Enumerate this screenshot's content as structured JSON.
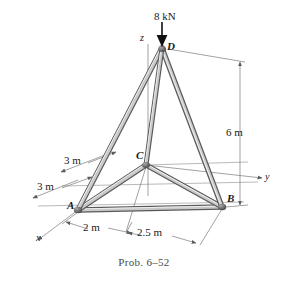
{
  "figure": {
    "caption": "Prob. 6–52",
    "type": "space-truss-free-body-diagram",
    "joints": [
      {
        "id": "A",
        "label": "A",
        "x": 78,
        "y": 210
      },
      {
        "id": "B",
        "label": "B",
        "x": 222,
        "y": 207
      },
      {
        "id": "C",
        "label": "C",
        "x": 146,
        "y": 165
      },
      {
        "id": "D",
        "label": "D",
        "x": 162,
        "y": 48
      }
    ],
    "axes": [
      {
        "id": "x",
        "label": "x"
      },
      {
        "id": "y",
        "label": "y"
      },
      {
        "id": "z",
        "label": "z"
      }
    ],
    "load": {
      "label": "8 kN",
      "magnitude": 8,
      "unit": "kN",
      "direction": "downward",
      "applied_at": "D"
    },
    "dimensions": [
      {
        "id": "height",
        "label": "6 m",
        "value": 6,
        "unit": "m",
        "orientation": "vertical"
      },
      {
        "id": "depth-upper",
        "label": "3 m",
        "value": 3,
        "unit": "m",
        "orientation": "oblique"
      },
      {
        "id": "depth-lower",
        "label": "3 m",
        "value": 3,
        "unit": "m",
        "orientation": "oblique"
      },
      {
        "id": "base-left",
        "label": "2 m",
        "value": 2,
        "unit": "m",
        "orientation": "oblique"
      },
      {
        "id": "base-right",
        "label": "2.5 m",
        "value": 2.5,
        "unit": "m",
        "orientation": "oblique"
      }
    ],
    "members": [
      {
        "from": "A",
        "to": "B"
      },
      {
        "from": "A",
        "to": "C"
      },
      {
        "from": "B",
        "to": "C"
      },
      {
        "from": "A",
        "to": "D"
      },
      {
        "from": "B",
        "to": "D"
      },
      {
        "from": "C",
        "to": "D"
      }
    ],
    "colors": {
      "member_stroke": "#4d4d4d",
      "member_fill": "#b3b3b3",
      "line": "#6b6b6b",
      "text": "#1a1a1a",
      "caption": "#4a4a4a",
      "background": "#ffffff"
    }
  }
}
